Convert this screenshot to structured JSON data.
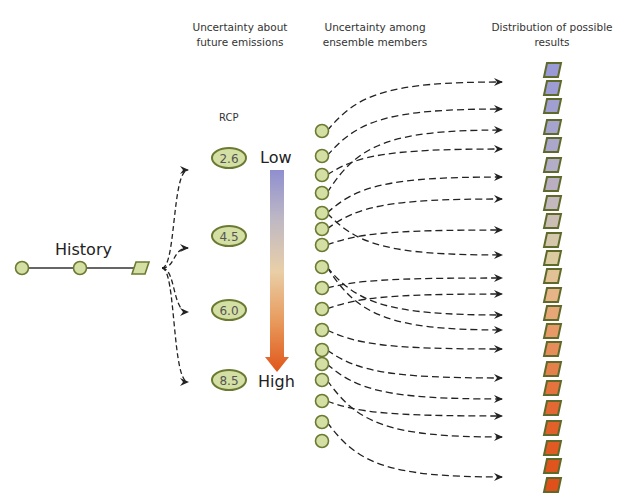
{
  "headers": {
    "emissions": [
      "Uncertainty about",
      "future emissions"
    ],
    "ensemble": [
      "Uncertainty among",
      "ensemble members"
    ],
    "distribution": [
      "Distribution of possible",
      "results"
    ]
  },
  "rcp": {
    "title": "RCP",
    "scenarios": [
      {
        "label": "2.6",
        "y": 158
      },
      {
        "label": "4.5",
        "y": 236
      },
      {
        "label": "6.0",
        "y": 310
      },
      {
        "label": "8.5",
        "y": 380
      }
    ]
  },
  "scale": {
    "low_label": "Low",
    "high_label": "High",
    "gradient": [
      "#8f8fd0",
      "#c0b9c4",
      "#e9cfa8",
      "#e89a5c",
      "#e0561a"
    ]
  },
  "history": {
    "label": "History",
    "nodes_x": [
      22,
      80
    ],
    "node_y": 268,
    "parallelogram_x": 140
  },
  "colors": {
    "node_fill": "#d4dfa3",
    "node_stroke": "#6b7a32",
    "arrow": "#222222",
    "result_stroke": "#5e6a2a"
  },
  "ensemble": {
    "x": 322,
    "members_y": [
      131,
      156,
      175,
      193,
      213,
      229,
      245,
      267,
      288,
      309,
      330,
      350,
      364,
      380,
      401,
      422,
      441
    ]
  },
  "arrows": [
    {
      "from": 0,
      "to_y": 82
    },
    {
      "from": 1,
      "to_y": 109
    },
    {
      "from": 3,
      "to_y": 130
    },
    {
      "from": 2,
      "to_y": 149
    },
    {
      "from": 4,
      "to_y": 177
    },
    {
      "from": 5,
      "to_y": 199
    },
    {
      "from": 6,
      "to_y": 230
    },
    {
      "from": 4,
      "to_y": 255
    },
    {
      "from": 8,
      "to_y": 278
    },
    {
      "from": 9,
      "to_y": 294
    },
    {
      "from": 7,
      "to_y": 315
    },
    {
      "from": 7,
      "to_y": 330
    },
    {
      "from": 10,
      "to_y": 349
    },
    {
      "from": 11,
      "to_y": 378
    },
    {
      "from": 12,
      "to_y": 399
    },
    {
      "from": 14,
      "to_y": 416
    },
    {
      "from": 13,
      "to_y": 437
    },
    {
      "from": 15,
      "to_y": 477
    }
  ],
  "results": {
    "x": 552,
    "y_values": [
      70,
      88,
      106,
      127,
      145,
      165,
      184,
      203,
      221,
      240,
      258,
      276,
      295,
      313,
      331,
      349,
      369,
      388,
      408,
      428,
      448,
      466,
      485
    ],
    "colors": [
      "#9a9ad6",
      "#9d9cd4",
      "#a19fd2",
      "#a6a3cf",
      "#aba7cc",
      "#b3adc8",
      "#baafc2",
      "#c2b8bd",
      "#cbbfb5",
      "#d4c7ab",
      "#dccaa1",
      "#e3c196",
      "#e6b486",
      "#e7a676",
      "#e79a68",
      "#e78d5a",
      "#e6804b",
      "#e4733e",
      "#e36833",
      "#e2602a",
      "#e15a24",
      "#e0551e",
      "#df501b"
    ]
  }
}
